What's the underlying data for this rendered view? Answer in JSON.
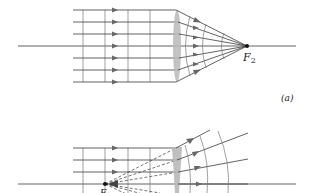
{
  "diagram": {
    "panel_a": {
      "label": "(a)",
      "focal_label": "F",
      "focal_subscript": "2",
      "description": "Parallel rays converging through a converging lens to focal point F2",
      "ray_count": 7
    },
    "panel_b": {
      "focal_label": "F",
      "focal_subscript": "1",
      "description": "Rays diverging from focal point F1 through a lens (partially visible)"
    },
    "colors": {
      "line": "#3a3a3a",
      "lens": "#b8b8b8",
      "background": "#ffffff"
    }
  }
}
